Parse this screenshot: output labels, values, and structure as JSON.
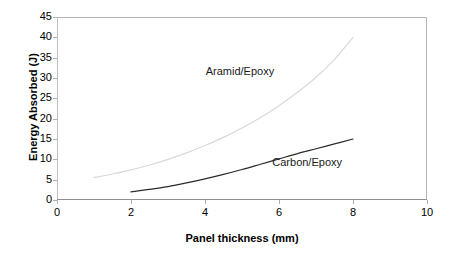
{
  "chart_data": {
    "type": "line",
    "title": "",
    "subtitle": "",
    "xlabel": "Panel thickness (mm)",
    "ylabel": "Energy Absorbed (J)",
    "xlim": [
      0,
      10
    ],
    "ylim": [
      0,
      45
    ],
    "xticks": [
      0,
      2,
      4,
      6,
      8,
      10
    ],
    "yticks": [
      0,
      5,
      10,
      15,
      20,
      25,
      30,
      35,
      40,
      45
    ],
    "xtick_labels": [
      "0",
      "2",
      "4",
      "6",
      "8",
      "10"
    ],
    "ytick_labels": [
      "0",
      "5",
      "10",
      "15",
      "20",
      "25",
      "30",
      "35",
      "40",
      "45"
    ],
    "grid": false,
    "legend_position": "inline-annotations",
    "series": [
      {
        "name": "Aramid/Epoxy",
        "color": "#d9d9d9",
        "label_x": 5.1,
        "label_y": 31.5,
        "x": [
          1.0,
          1.5,
          2.0,
          2.5,
          3.0,
          3.5,
          4.0,
          4.5,
          5.0,
          5.5,
          6.0,
          6.5,
          7.0,
          7.5,
          8.0
        ],
        "y": [
          5.5,
          6.4,
          7.4,
          8.6,
          10.0,
          11.6,
          13.4,
          15.4,
          17.7,
          20.3,
          23.2,
          26.5,
          30.2,
          34.6,
          40.0
        ]
      },
      {
        "name": "Carbon/Epoxy",
        "color": "#2b2b2b",
        "label_x": 6.9,
        "label_y": 9.2,
        "x": [
          2.0,
          2.5,
          3.0,
          3.5,
          4.0,
          4.5,
          5.0,
          5.5,
          6.0,
          6.5,
          7.0,
          7.5,
          8.0
        ],
        "y": [
          2.0,
          2.6,
          3.3,
          4.2,
          5.2,
          6.3,
          7.5,
          8.8,
          10.1,
          11.4,
          12.6,
          13.8,
          15.0
        ]
      }
    ]
  },
  "axes": {
    "x_title": "Panel thickness (mm)",
    "y_title": "Energy Absorbed (J)"
  },
  "annotations": {
    "aramid_label": "Aramid/Epoxy",
    "carbon_label": "Carbon/Epoxy"
  },
  "colors": {
    "aramid_series": "#d9d9d9",
    "carbon_series": "#2b2b2b",
    "axis_line": "#909090",
    "frame": "#bfbfbf",
    "text": "#000000",
    "background": "#ffffff"
  }
}
